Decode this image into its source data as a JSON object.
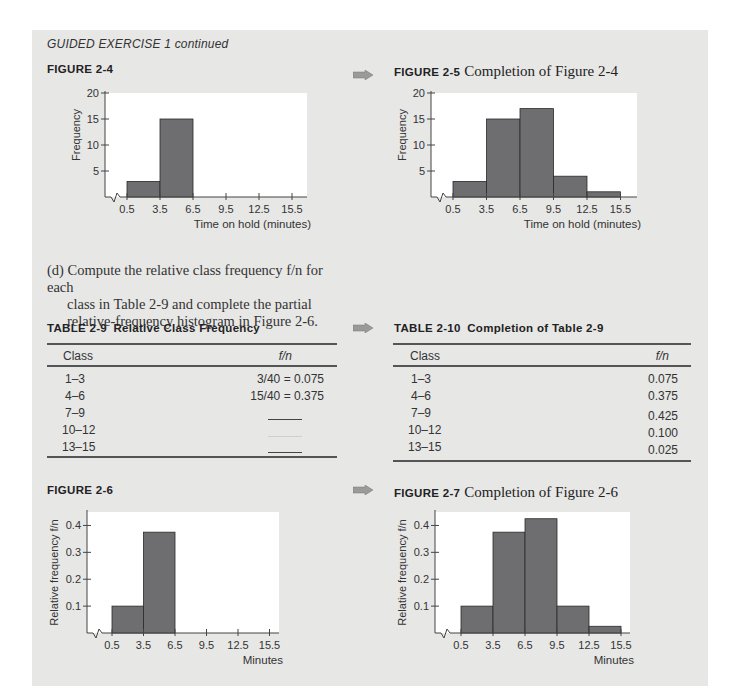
{
  "running_head": "GUIDED EXERCISE 1 continued",
  "figures": {
    "fig24": {
      "label": "FIGURE 2-4",
      "title": "",
      "ylabel": "Frequency",
      "xlabel": "Time on hold (minutes)",
      "yticks": [
        "20",
        "15",
        "10",
        "5"
      ],
      "xticks": [
        "0.5",
        "3.5",
        "6.5",
        "9.5",
        "12.5",
        "15.5"
      ]
    },
    "fig25": {
      "label": "FIGURE 2-5",
      "title": "Completion of Figure 2-4",
      "ylabel": "Frequency",
      "xlabel": "Time on hold (minutes)",
      "yticks": [
        "20",
        "15",
        "10",
        "5"
      ],
      "xticks": [
        "0.5",
        "3.5",
        "6.5",
        "9.5",
        "12.5",
        "15.5"
      ]
    },
    "fig26": {
      "label": "FIGURE 2-6",
      "title": "",
      "ylabel": "Relative frequency f/n",
      "xlabel": "Minutes",
      "yticks": [
        "0.4",
        "0.3",
        "0.2",
        "0.1"
      ],
      "xticks": [
        "0.5",
        "3.5",
        "6.5",
        "9.5",
        "12.5",
        "15.5"
      ]
    },
    "fig27": {
      "label": "FIGURE 2-7",
      "title": "Completion of Figure 2-6",
      "ylabel": "Relative frequency f/n",
      "xlabel": "Minutes",
      "yticks": [
        "0.4",
        "0.3",
        "0.2",
        "0.1"
      ],
      "xticks": [
        "0.5",
        "3.5",
        "6.5",
        "9.5",
        "12.5",
        "15.5"
      ]
    }
  },
  "instruction": {
    "line1": "(d) Compute the relative class frequency f/n for each",
    "line2": "class in Table 2-9 and complete the partial",
    "line3": "relative-frequency histogram in Figure 2-6."
  },
  "table29": {
    "label": "TABLE 2-9",
    "title": "Relative Class Frequency",
    "headers": [
      "Class",
      "f/n"
    ],
    "rows": [
      [
        "1–3",
        "3/40 = 0.075"
      ],
      [
        "4–6",
        "15/40 = 0.375"
      ],
      [
        "7–9",
        ""
      ],
      [
        "10–12",
        ""
      ],
      [
        "13–15",
        ""
      ]
    ]
  },
  "table210": {
    "label": "TABLE 2-10",
    "title": "Completion of Table 2-9",
    "headers": [
      "Class",
      "f/n"
    ],
    "rows": [
      [
        "1–3",
        "0.075"
      ],
      [
        "4–6",
        "0.375"
      ],
      [
        "7–9",
        "0.425"
      ],
      [
        "10–12",
        "0.100"
      ],
      [
        "13–15",
        "0.025"
      ]
    ]
  },
  "colors": {
    "panel": "#e7e7e6",
    "bar": "#6e6e70",
    "bar_edge": "#2a2a2a",
    "plot_bg": "#ffffff",
    "arrow": "#9a9a9a"
  },
  "chart_data": [
    {
      "type": "bar",
      "title": "FIGURE 2-4",
      "xlabel": "Time on hold (minutes)",
      "ylabel": "Frequency",
      "bin_edges": [
        0.5,
        3.5,
        6.5,
        9.5,
        12.5,
        15.5
      ],
      "categories": [
        "0.5-3.5",
        "3.5-6.5",
        "6.5-9.5",
        "9.5-12.5",
        "12.5-15.5"
      ],
      "values": [
        3,
        15,
        null,
        null,
        null
      ],
      "ylim": [
        0,
        20
      ],
      "grid": false
    },
    {
      "type": "bar",
      "title": "FIGURE 2-5 Completion of Figure 2-4",
      "xlabel": "Time on hold (minutes)",
      "ylabel": "Frequency",
      "bin_edges": [
        0.5,
        3.5,
        6.5,
        9.5,
        12.5,
        15.5
      ],
      "categories": [
        "0.5-3.5",
        "3.5-6.5",
        "6.5-9.5",
        "9.5-12.5",
        "12.5-15.5"
      ],
      "values": [
        3,
        15,
        17,
        4,
        1
      ],
      "ylim": [
        0,
        20
      ],
      "grid": false
    },
    {
      "type": "bar",
      "title": "FIGURE 2-6",
      "xlabel": "Minutes",
      "ylabel": "Relative frequency f/n",
      "bin_edges": [
        0.5,
        3.5,
        6.5,
        9.5,
        12.5,
        15.5
      ],
      "categories": [
        "0.5-3.5",
        "3.5-6.5",
        "6.5-9.5",
        "9.5-12.5",
        "12.5-15.5"
      ],
      "values": [
        0.1,
        0.375,
        null,
        null,
        null
      ],
      "ylim": [
        0,
        0.45
      ],
      "grid": false
    },
    {
      "type": "bar",
      "title": "FIGURE 2-7 Completion of Figure 2-6",
      "xlabel": "Minutes",
      "ylabel": "Relative frequency f/n",
      "bin_edges": [
        0.5,
        3.5,
        6.5,
        9.5,
        12.5,
        15.5
      ],
      "categories": [
        "0.5-3.5",
        "3.5-6.5",
        "6.5-9.5",
        "9.5-12.5",
        "12.5-15.5"
      ],
      "values": [
        0.1,
        0.375,
        0.425,
        0.1,
        0.025
      ],
      "ylim": [
        0,
        0.45
      ],
      "grid": false
    }
  ]
}
